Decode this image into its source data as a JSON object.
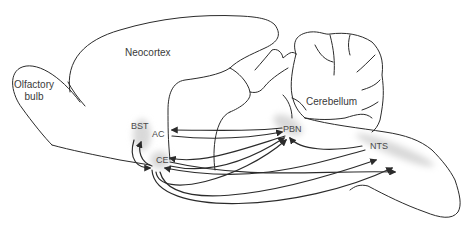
{
  "diagram": {
    "type": "brain-sagittal-schematic",
    "regions": {
      "olfactory_bulb": {
        "line1": "Olfactory",
        "line2": "bulb"
      },
      "neocortex": {
        "label": "Neocortex"
      },
      "cerebellum": {
        "label": "Cerebellum"
      },
      "bst": {
        "label": "BST"
      },
      "ac": {
        "label": "AC"
      },
      "ce": {
        "label": "CE"
      },
      "pbn": {
        "label": "PBN"
      },
      "nts": {
        "label": "NTS"
      }
    },
    "highlight_color": "#d9d9d9",
    "line_color": "#2b2b2b",
    "connections": [
      {
        "from": "PBN",
        "to": "AC"
      },
      {
        "from": "PBN",
        "to": "CE"
      },
      {
        "from": "NTS",
        "to": "PBN"
      },
      {
        "from": "NTS",
        "to": "CE"
      },
      {
        "from": "CE",
        "to": "PBN"
      },
      {
        "from": "CE",
        "to": "NTS"
      },
      {
        "from": "BST",
        "to": "PBN"
      },
      {
        "from": "BST",
        "to": "NTS"
      },
      {
        "from": "CE",
        "to": "BST"
      },
      {
        "from": "AC",
        "to": "PBN"
      }
    ]
  }
}
